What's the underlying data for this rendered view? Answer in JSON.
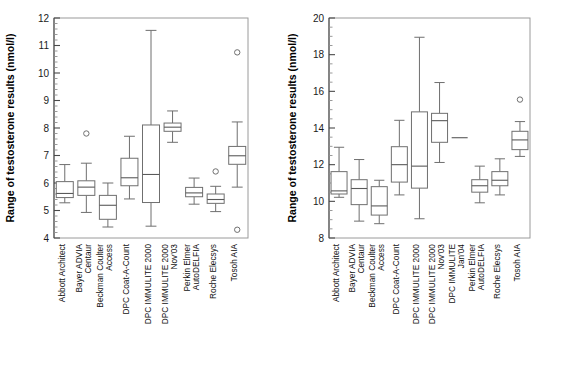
{
  "figure": {
    "ylabel": "Range of testosterone results (nmol/l)",
    "panels": [
      "left",
      "right"
    ]
  },
  "chart_data": [
    {
      "type": "box",
      "panel": "left",
      "title": "",
      "xlabel": "",
      "ylabel": "Range of testosterone results (nmol/l)",
      "ylim": [
        4,
        12
      ],
      "yticks": [
        4,
        5,
        6,
        7,
        8,
        9,
        10,
        11,
        12
      ],
      "ytick_labels": [
        "4",
        "5",
        "6",
        "7",
        "8",
        "9",
        "10",
        "11",
        "12"
      ],
      "minor_ticks_per_interval": 5,
      "grid": false,
      "legend": "none",
      "categories": [
        "Abbott Architect",
        "Bayer ADVIA Centaur",
        "Beckman Coulter Access",
        "DPC Coat-A-Count",
        "DPC IMMULITE 2000",
        "DPC IMMULITE 2000 Nov'03",
        "Perkin Elmer AutoDELFIA",
        "Roche Elecsys",
        "Tosoh AIA"
      ],
      "boxes": [
        {
          "category": "Abbott Architect",
          "whisker_low": 5.28,
          "q1": 5.47,
          "median": 5.62,
          "q3": 6.05,
          "whisker_high": 6.67,
          "outliers": []
        },
        {
          "category": "Bayer ADVIA Centaur",
          "whisker_low": 4.93,
          "q1": 5.55,
          "median": 5.85,
          "q3": 6.08,
          "whisker_high": 6.72,
          "outliers": [
            7.8
          ]
        },
        {
          "category": "Beckman Coulter Access",
          "whisker_low": 4.4,
          "q1": 4.68,
          "median": 5.19,
          "q3": 5.55,
          "whisker_high": 6.0,
          "outliers": []
        },
        {
          "category": "DPC Coat-A-Count",
          "whisker_low": 5.42,
          "q1": 5.9,
          "median": 6.19,
          "q3": 6.9,
          "whisker_high": 7.7,
          "outliers": []
        },
        {
          "category": "DPC IMMULITE 2000",
          "whisker_low": 4.43,
          "q1": 5.29,
          "median": 6.31,
          "q3": 8.11,
          "whisker_high": 11.55,
          "outliers": []
        },
        {
          "category": "DPC IMMULITE 2000 Nov'03",
          "whisker_low": 7.48,
          "q1": 7.88,
          "median": 8.03,
          "q3": 8.18,
          "whisker_high": 8.62,
          "outliers": []
        },
        {
          "category": "Perkin Elmer AutoDELFIA",
          "whisker_low": 5.23,
          "q1": 5.5,
          "median": 5.64,
          "q3": 5.84,
          "whisker_high": 6.18,
          "outliers": []
        },
        {
          "category": "Roche Elecsys",
          "whisker_low": 4.96,
          "q1": 5.26,
          "median": 5.4,
          "q3": 5.6,
          "whisker_high": 5.88,
          "outliers": [
            6.42
          ]
        },
        {
          "category": "Tosoh AIA",
          "whisker_low": 5.85,
          "q1": 6.68,
          "median": 6.99,
          "q3": 7.33,
          "whisker_high": 8.22,
          "outliers": [
            10.75,
            4.3
          ]
        }
      ]
    },
    {
      "type": "box",
      "panel": "right",
      "title": "",
      "xlabel": "",
      "ylabel": "Range of testosterone results (nmol/l)",
      "ylim": [
        8,
        20
      ],
      "yticks": [
        8,
        10,
        12,
        14,
        16,
        18,
        20
      ],
      "ytick_labels": [
        "8",
        "10",
        "12",
        "14",
        "16",
        "18",
        "20"
      ],
      "minor_ticks_per_interval": 4,
      "grid": false,
      "legend": "none",
      "categories": [
        "Abbott Architect",
        "Bayer ADVIA Centaur",
        "Beckman Coulter Access",
        "DPC Coat-A-Count",
        "DPC IMMULITE 2000",
        "DPC IMMULITE 2000 Nov'03",
        "DPC IMMULITE Jan'04",
        "Perkin Elmer AutoDELFIA",
        "Roche Elecsys",
        "Tosoh AIA"
      ],
      "boxes": [
        {
          "category": "Abbott Architect",
          "whisker_low": 10.22,
          "q1": 10.4,
          "median": 10.57,
          "q3": 11.62,
          "whisker_high": 12.95,
          "outliers": []
        },
        {
          "category": "Bayer ADVIA Centaur",
          "whisker_low": 8.92,
          "q1": 9.82,
          "median": 10.7,
          "q3": 11.18,
          "whisker_high": 12.28,
          "outliers": []
        },
        {
          "category": "Beckman Coulter Access",
          "whisker_low": 8.78,
          "q1": 9.25,
          "median": 9.75,
          "q3": 10.8,
          "whisker_high": 11.15,
          "outliers": []
        },
        {
          "category": "DPC Coat-A-Count",
          "whisker_low": 10.35,
          "q1": 11.05,
          "median": 12.0,
          "q3": 12.98,
          "whisker_high": 14.42,
          "outliers": []
        },
        {
          "category": "DPC IMMULITE 2000",
          "whisker_low": 9.05,
          "q1": 10.72,
          "median": 11.92,
          "q3": 14.88,
          "whisker_high": 18.95,
          "outliers": []
        },
        {
          "category": "DPC IMMULITE 2000 Nov'03",
          "whisker_low": 12.12,
          "q1": 13.22,
          "median": 14.4,
          "q3": 14.8,
          "whisker_high": 16.48,
          "outliers": []
        },
        {
          "category": "DPC IMMULITE Jan'04",
          "whisker_low": 13.47,
          "q1": 13.47,
          "median": 13.47,
          "q3": 13.47,
          "whisker_high": 13.47,
          "outliers": []
        },
        {
          "category": "Perkin Elmer AutoDELFIA",
          "whisker_low": 9.92,
          "q1": 10.5,
          "median": 10.85,
          "q3": 11.18,
          "whisker_high": 11.92,
          "outliers": []
        },
        {
          "category": "Roche Elecsys",
          "whisker_low": 10.35,
          "q1": 10.85,
          "median": 11.15,
          "q3": 11.62,
          "whisker_high": 12.32,
          "outliers": []
        },
        {
          "category": "Tosoh AIA",
          "whisker_low": 12.45,
          "q1": 12.82,
          "median": 13.35,
          "q3": 13.82,
          "whisker_high": 14.35,
          "outliers": [
            15.55
          ]
        }
      ]
    }
  ]
}
